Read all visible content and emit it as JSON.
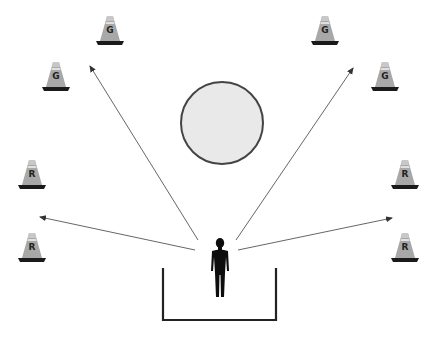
{
  "diagram": {
    "colors": {
      "cone_body": "#a8a8a8",
      "cone_base": "#1a1a1a",
      "arrow": "#555555",
      "circle_fill": "#e9e9e9",
      "circle_stroke": "#444444",
      "person": "#0d0d0d",
      "box": "#222222"
    },
    "cones": [
      {
        "id": "top-left-upper",
        "label": "G",
        "x": 110,
        "y": 16
      },
      {
        "id": "top-left-lower",
        "label": "G",
        "x": 56,
        "y": 62
      },
      {
        "id": "top-right-upper",
        "label": "G",
        "x": 325,
        "y": 16
      },
      {
        "id": "top-right-lower",
        "label": "G",
        "x": 385,
        "y": 62
      },
      {
        "id": "mid-left-upper",
        "label": "R",
        "x": 32,
        "y": 160
      },
      {
        "id": "mid-left-lower",
        "label": "R",
        "x": 32,
        "y": 233
      },
      {
        "id": "mid-right-upper",
        "label": "R",
        "x": 405,
        "y": 160
      },
      {
        "id": "mid-right-lower",
        "label": "R",
        "x": 405,
        "y": 233
      }
    ],
    "arrows": [
      {
        "target": "top-left",
        "x1": 198,
        "y1": 240,
        "x2": 90,
        "y2": 66
      },
      {
        "target": "top-right",
        "x1": 236,
        "y1": 240,
        "x2": 353,
        "y2": 68
      },
      {
        "target": "left",
        "x1": 195,
        "y1": 250,
        "x2": 40,
        "y2": 217
      },
      {
        "target": "right",
        "x1": 238,
        "y1": 250,
        "x2": 392,
        "y2": 218
      }
    ],
    "center_circle": {
      "cx": 222,
      "cy": 123,
      "r": 41
    },
    "person": {
      "x": 220,
      "y": 240
    },
    "start_box": {
      "x1": 163,
      "x2": 276,
      "top": 268,
      "bottom": 320
    }
  }
}
